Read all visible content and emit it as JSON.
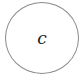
{
  "diagram": {
    "nodes": [
      {
        "id": "c",
        "label": "c",
        "shape": "circle",
        "stroke": "#8a8a8a"
      }
    ]
  }
}
